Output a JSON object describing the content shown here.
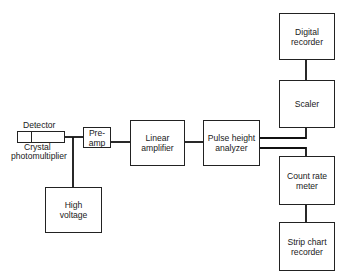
{
  "title": {
    "text": "",
    "note": "clipped-at-top"
  },
  "diagram": {
    "nodes": {
      "detector": {
        "label": "Detector"
      },
      "crystal_photomultiplier": {
        "label": "Crystal\nphotomultiplier",
        "line1": "Crystal",
        "line2": "photomultiplier"
      },
      "preamp": {
        "line1": "Pre-",
        "line2": "amp"
      },
      "high_voltage": {
        "line1": "High",
        "line2": "voltage"
      },
      "linear_amplifier": {
        "line1": "Linear",
        "line2": "amplifier"
      },
      "pulse_height_analyzer": {
        "line1": "Pulse height",
        "line2": "analyzer"
      },
      "digital_recorder": {
        "line1": "Digital",
        "line2": "recorder"
      },
      "scaler": {
        "line1": "Scaler"
      },
      "count_rate_meter": {
        "line1": "Count rate",
        "line2": "meter"
      },
      "strip_chart_recorder": {
        "line1": "Strip chart",
        "line2": "recorder"
      }
    },
    "edges": [
      [
        "detector",
        "preamp"
      ],
      [
        "detector",
        "high_voltage"
      ],
      [
        "preamp",
        "linear_amplifier"
      ],
      [
        "linear_amplifier",
        "pulse_height_analyzer"
      ],
      [
        "pulse_height_analyzer",
        "scaler"
      ],
      [
        "pulse_height_analyzer",
        "count_rate_meter"
      ],
      [
        "scaler",
        "digital_recorder"
      ],
      [
        "count_rate_meter",
        "strip_chart_recorder"
      ]
    ],
    "colors": {
      "line": "#111111",
      "box_border": "#222222",
      "background": "#ffffff"
    }
  }
}
